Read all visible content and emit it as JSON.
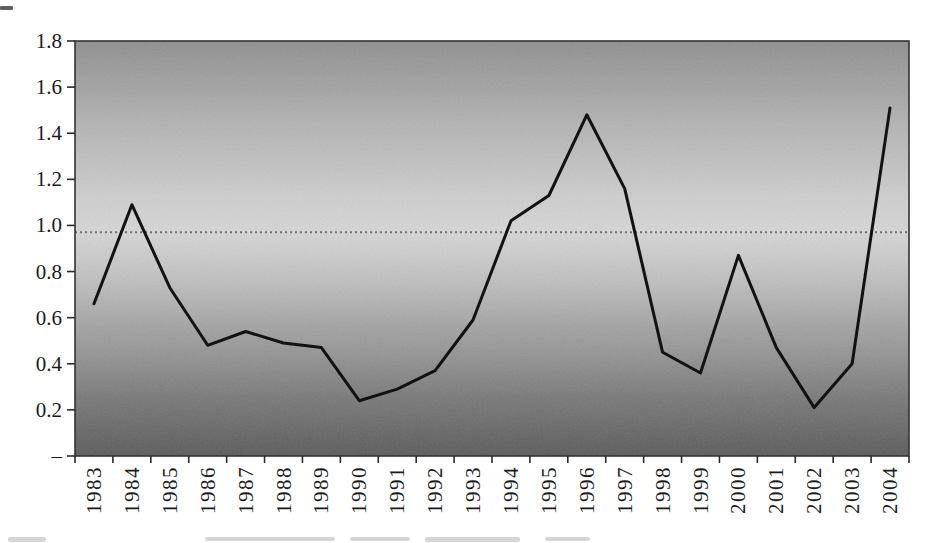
{
  "figure": {
    "background_color": "#ffffff",
    "scan_artifacts": {
      "corner_mark_top_left": true,
      "cropped_caption_bottom": true
    }
  },
  "chart_data": {
    "type": "line",
    "title": "",
    "xlabel": "",
    "ylabel": "",
    "categories": [
      "1983",
      "1984",
      "1985",
      "1986",
      "1987",
      "1988",
      "1989",
      "1990",
      "1991",
      "1992",
      "1993",
      "1994",
      "1995",
      "1996",
      "1997",
      "1998",
      "1999",
      "2000",
      "2001",
      "2002",
      "2003",
      "2004"
    ],
    "series": [
      {
        "name": "series-1",
        "color": "#121212",
        "values": [
          0.66,
          1.09,
          0.73,
          0.48,
          0.54,
          0.49,
          0.47,
          0.24,
          0.29,
          0.37,
          0.59,
          1.02,
          1.13,
          1.48,
          1.16,
          0.45,
          0.36,
          0.87,
          0.47,
          0.21,
          0.4,
          1.51
        ]
      }
    ],
    "ylim": [
      0,
      1.8
    ],
    "y_ticks": [
      {
        "label": "1.8",
        "value": 1.8
      },
      {
        "label": "1.6",
        "value": 1.6
      },
      {
        "label": "1.4",
        "value": 1.4
      },
      {
        "label": "1.2",
        "value": 1.2
      },
      {
        "label": "1.0",
        "value": 1.0
      },
      {
        "label": "0.8",
        "value": 0.8
      },
      {
        "label": "0.6",
        "value": 0.6
      },
      {
        "label": "0.4",
        "value": 0.4
      },
      {
        "label": "0.2",
        "value": 0.2
      },
      {
        "label": "–",
        "value": 0
      }
    ],
    "reference_line": {
      "value": 0.97,
      "color": "#6f6f6f",
      "style": "dotted"
    },
    "grid": false,
    "legend": "none",
    "x_label_rotation_deg": -90,
    "axis_color": "#2a2a2a",
    "label_color": "#1b1b1b",
    "plot_border_color": "#333333",
    "plot_background": {
      "type": "vertical-gradient",
      "stops": [
        {
          "offset": 0.0,
          "color": "#8f8f8f"
        },
        {
          "offset": 0.2,
          "color": "#b3b3b3"
        },
        {
          "offset": 0.38,
          "color": "#cecece"
        },
        {
          "offset": 0.46,
          "color": "#d6d6d6"
        },
        {
          "offset": 0.58,
          "color": "#bebebe"
        },
        {
          "offset": 0.72,
          "color": "#9c9c9c"
        },
        {
          "offset": 0.86,
          "color": "#7a7a7a"
        },
        {
          "offset": 1.0,
          "color": "#5c5c5c"
        }
      ]
    }
  }
}
